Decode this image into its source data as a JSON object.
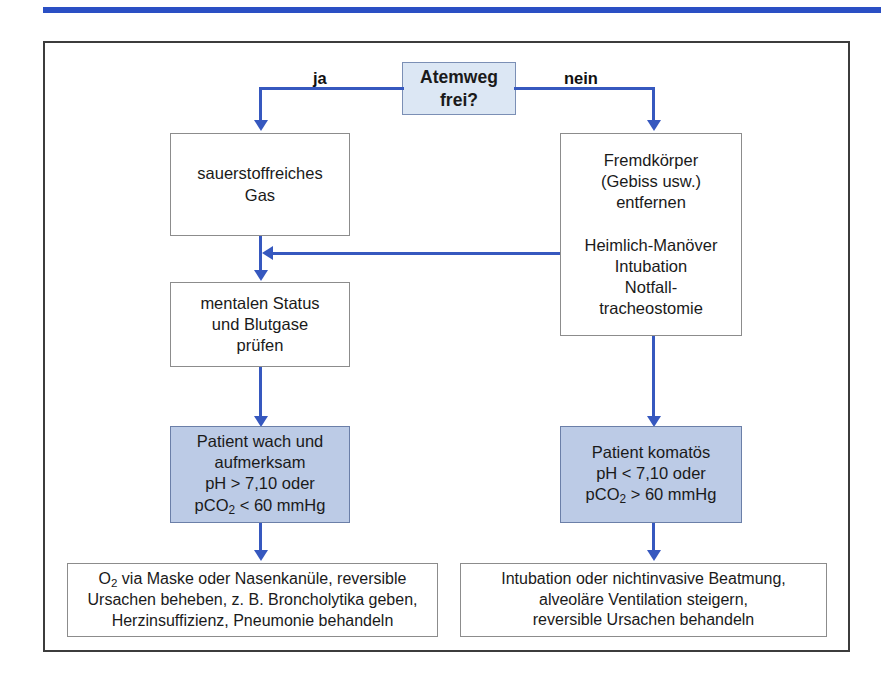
{
  "diagram": {
    "type": "flowchart",
    "top_rule_color": "#2a4fc4",
    "connector_color": "#3658bf",
    "shaded_fill": "#bccbe6",
    "decision_fill": "#dce7f4",
    "nodes": {
      "decision": {
        "label": "Atemweg\nfrei?",
        "line1": "Atemweg",
        "line2": "frei?"
      },
      "left_1": {
        "line1": "sauerstoffreiches",
        "line2": "Gas"
      },
      "left_2": {
        "line1": "mentalen Status",
        "line2": "und Blutgase",
        "line3": "prüfen"
      },
      "left_3": {
        "line1": "Patient wach und",
        "line2": "aufmerksam",
        "line3": "pH > 7,10 oder",
        "line4_pre": "pCO",
        "line4_sub": "2",
        "line4_post": " < 60 mmHg"
      },
      "left_4": {
        "line1_pre": "O",
        "line1_sub": "2",
        "line1_post": " via Maske oder Nasenkanüle, reversible",
        "line2": "Ursachen beheben, z. B. Broncholytika geben,",
        "line3": "Herzinsuffizienz, Pneumonie behandeln"
      },
      "right_1": {
        "line1": "Fremdkörper",
        "line2": "(Gebiss usw.)",
        "line3": "entfernen",
        "line4": "",
        "line5": "Heimlich-Manöver",
        "line6": "Intubation",
        "line7": "Notfall-",
        "line8": "tracheostomie"
      },
      "right_2": {
        "line1": "Patient komatös",
        "line2": "pH < 7,10 oder",
        "line3_pre": "pCO",
        "line3_sub": "2",
        "line3_post": " > 60 mmHg"
      },
      "right_3": {
        "line1": "Intubation oder nichtinvasive Beatmung,",
        "line2": "alveoläre Ventilation steigern,",
        "line3": "reversible Ursachen behandeln"
      }
    },
    "branch_labels": {
      "yes": "ja",
      "no": "nein"
    }
  }
}
